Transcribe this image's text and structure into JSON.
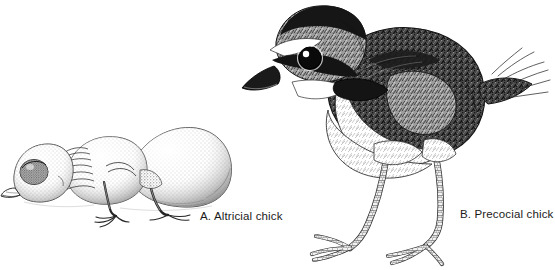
{
  "figure": {
    "background_color": "#ffffff",
    "ink_color": "#1b1b1b",
    "medium": "pen-and-ink stipple illustration"
  },
  "panels": [
    {
      "id": "altricial",
      "caption": "A. Altricial chick",
      "illustration_name": "altricial-chick-drawing",
      "description": "naked hatchling lying prone with bulging closed eye, short beak, wrinkled skin, weak splayed feet"
    },
    {
      "id": "precocial",
      "caption": "B. Precocial chick",
      "illustration_name": "precocial-chick-drawing",
      "description": "downy plover-like chick standing upright with dark eye stripe, white brow, dark bill, dark collar band, fluffy mottled back, white underside, long scaled legs with three toes"
    }
  ],
  "captions": {
    "altricial": "A. Altricial chick",
    "precocial": "B. Precocial chick"
  },
  "colors": {
    "ink": "#1b1b1b",
    "mid_tone": "#6f6f6f",
    "light_tone": "#b8b8b8",
    "paper": "#ffffff"
  }
}
